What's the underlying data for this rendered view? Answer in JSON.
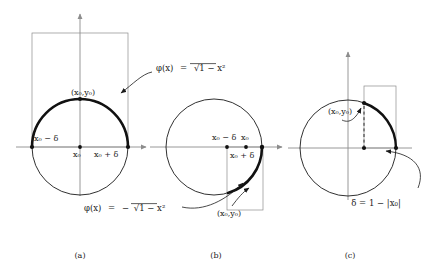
{
  "figure": {
    "background": "#ffffff",
    "ink": "#1a1a1a",
    "thin_gray": "#8c8c8c",
    "thick_stroke": "#111111",
    "panels": [
      {
        "id": "a",
        "caption": "(a)",
        "center": {
          "x": 80,
          "y": 147
        },
        "radius": 48,
        "circle_label": "unit-circle",
        "highlight": {
          "type": "upper-semicircle",
          "from_deg": 180,
          "to_deg": 0
        },
        "axis_labels": {
          "left": "x₀ − δ",
          "center": "x₀",
          "right": "x₀ + δ"
        },
        "point_label": "(x₀,y₀)",
        "formula": "φ(x) = √¯1 − x²",
        "formula_parts": {
          "lhs": "φ(x)",
          "eq": "=",
          "sign": "",
          "radicand": "1 − x²"
        },
        "box": {
          "x": 32,
          "y": 33,
          "w": 96,
          "h": 114
        }
      },
      {
        "id": "b",
        "caption": "(b)",
        "center": {
          "x": 214,
          "y": 147
        },
        "radius": 48,
        "circle_label": "unit-circle",
        "highlight": {
          "type": "lower-right-arc",
          "from_deg": 0,
          "to_deg": -75
        },
        "axis_labels": {
          "left": "x₀ − δ",
          "center": "x₀",
          "below": "x₀ + δ"
        },
        "point_label": "(x₀,y₀)",
        "formula": "φ(x) = −√¯1 − x²",
        "formula_parts": {
          "lhs": "φ(x)",
          "eq": "=",
          "sign": "−",
          "radicand": "1 − x²"
        },
        "box": {
          "x": 227,
          "y": 147,
          "w": 36,
          "h": 63
        }
      },
      {
        "id": "c",
        "caption": "(c)",
        "center": {
          "x": 348,
          "y": 148
        },
        "radius": 48,
        "circle_label": "unit-circle",
        "highlight": {
          "type": "small-right-arc",
          "from_deg": 48,
          "to_deg": 0
        },
        "point_label": "(x₀,y₀)",
        "delta_label": "δ = 1 − |x₀|",
        "box": {
          "x": 364,
          "y": 86,
          "w": 32,
          "h": 62
        }
      }
    ]
  },
  "captions": {
    "a": "(a)",
    "b": "(b)",
    "c": "(c)"
  },
  "math": {
    "phi_pos": "φ(x)  =  √1 − x²",
    "phi_neg": "φ(x)  =  −√1 − x²",
    "delta_def": "δ = 1 − |x₀|",
    "x0": "x₀",
    "x0_minus_d": "x₀ − δ",
    "x0_plus_d": "x₀ + δ",
    "point": "(x₀,y₀)"
  }
}
